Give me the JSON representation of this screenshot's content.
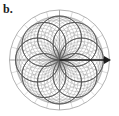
{
  "figure": {
    "panel_label": "b.",
    "type": "polar-radiation-pattern",
    "background_color": "#ffffff"
  },
  "colors": {
    "grid": "#b9b9b9",
    "grid_outer": "#a0a0a0",
    "axis": "#9a9a9a",
    "lobe_curve": "#555555",
    "lobe_curve_light": "#7d7d7d",
    "arrow": "#1c1c1c",
    "label_text": "#1a1a1a"
  },
  "arrow": {
    "name": "direction-arrow",
    "label": "",
    "from_x": 59.5,
    "from_y": 60,
    "to_x": 111,
    "to_y": 60,
    "head_width": 8,
    "head_height": 7
  },
  "chart_data": {
    "type": "line",
    "plot_style": "polar",
    "title": "",
    "subtitle": "",
    "xlabel": "",
    "ylabel": "",
    "legend_position": "none",
    "grid": true,
    "annotations": [
      "b."
    ],
    "polar": {
      "center_x": 59.5,
      "center_y": 60,
      "outer_radius": 50,
      "ring_count": 5,
      "ring_radii": [
        10,
        20,
        30,
        40,
        50
      ],
      "spoke_count": 24,
      "spoke_step_deg": 15,
      "theta_range_deg": [
        0,
        360
      ],
      "r_range": [
        0,
        1
      ]
    },
    "series": [
      {
        "name": "lobe-family-1",
        "n": 1,
        "petals": 4,
        "lobe_radius": 0.44,
        "tilt_deg": 0
      },
      {
        "name": "lobe-family-2",
        "n": 2,
        "petals": 4,
        "lobe_radius": 0.44,
        "tilt_deg": 9
      },
      {
        "name": "lobe-family-3",
        "n": 3,
        "petals": 4,
        "lobe_radius": 0.44,
        "tilt_deg": 18
      },
      {
        "name": "lobe-family-4",
        "n": 4,
        "petals": 4,
        "lobe_radius": 0.44,
        "tilt_deg": 27
      },
      {
        "name": "lobe-family-5",
        "n": 5,
        "petals": 4,
        "lobe_radius": 0.44,
        "tilt_deg": 36
      },
      {
        "name": "lobe-family-6",
        "n": 6,
        "petals": 4,
        "lobe_radius": 0.44,
        "tilt_deg": 45
      }
    ],
    "main_lobe_angles_deg": [
      45,
      135,
      225,
      315
    ],
    "main_lobe_peak_r": 0.88
  }
}
